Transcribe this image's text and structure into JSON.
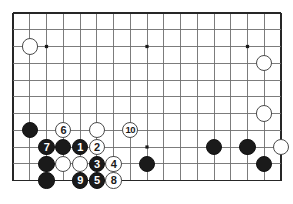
{
  "figure": {
    "kind": "go-board-diagram",
    "title": "",
    "board": {
      "cols": 17,
      "rows": 11,
      "left": 13,
      "top": 13,
      "spacing": 16.75,
      "line_color": "#6e6e6e",
      "border_color": "#262626",
      "background": "#ffffff",
      "stone_radius": 8.2
    },
    "star_points": [
      {
        "col": 2,
        "row": 2
      },
      {
        "col": 8,
        "row": 2
      },
      {
        "col": 14,
        "row": 2
      },
      {
        "col": 8,
        "row": 8
      }
    ],
    "stones": [
      {
        "id": "w-upper-left-corner",
        "color": "white",
        "col": 1,
        "row": 2,
        "label": ""
      },
      {
        "id": "w-right-upper",
        "color": "white",
        "col": 15,
        "row": 3,
        "label": ""
      },
      {
        "id": "w-right-mid",
        "color": "white",
        "col": 15,
        "row": 6,
        "label": ""
      },
      {
        "id": "b-left-shoulder",
        "color": "black",
        "col": 1,
        "row": 7,
        "label": ""
      },
      {
        "id": "w-move-6",
        "color": "white",
        "col": 3,
        "row": 7,
        "label": "6"
      },
      {
        "id": "w-upper-wall",
        "color": "white",
        "col": 5,
        "row": 7,
        "label": ""
      },
      {
        "id": "w-move-10",
        "color": "white",
        "col": 7,
        "row": 7,
        "label": "10"
      },
      {
        "id": "b-move-7",
        "color": "black",
        "col": 2,
        "row": 8,
        "label": "7"
      },
      {
        "id": "b-wall-upper",
        "color": "black",
        "col": 3,
        "row": 8,
        "label": ""
      },
      {
        "id": "b-move-1",
        "color": "black",
        "col": 4,
        "row": 8,
        "label": "1"
      },
      {
        "id": "w-move-2",
        "color": "white",
        "col": 5,
        "row": 8,
        "label": "2"
      },
      {
        "id": "b-right-group-a",
        "color": "black",
        "col": 12,
        "row": 8,
        "label": ""
      },
      {
        "id": "b-right-group-b",
        "color": "black",
        "col": 14,
        "row": 8,
        "label": ""
      },
      {
        "id": "w-right-lower",
        "color": "white",
        "col": 16,
        "row": 8,
        "label": ""
      },
      {
        "id": "b-left-wall-mid",
        "color": "black",
        "col": 2,
        "row": 9,
        "label": ""
      },
      {
        "id": "w-captured-a",
        "color": "white",
        "col": 3,
        "row": 9,
        "label": ""
      },
      {
        "id": "w-captured-b",
        "color": "white",
        "col": 4,
        "row": 9,
        "label": ""
      },
      {
        "id": "b-move-3",
        "color": "black",
        "col": 5,
        "row": 9,
        "label": "3"
      },
      {
        "id": "w-move-4",
        "color": "white",
        "col": 6,
        "row": 9,
        "label": "4"
      },
      {
        "id": "b-center-lone",
        "color": "black",
        "col": 8,
        "row": 9,
        "label": ""
      },
      {
        "id": "b-right-group-c",
        "color": "black",
        "col": 15,
        "row": 9,
        "label": ""
      },
      {
        "id": "b-left-wall-low",
        "color": "black",
        "col": 2,
        "row": 10,
        "label": ""
      },
      {
        "id": "b-move-9",
        "color": "black",
        "col": 4,
        "row": 10,
        "label": "9"
      },
      {
        "id": "b-move-5",
        "color": "black",
        "col": 5,
        "row": 10,
        "label": "5"
      },
      {
        "id": "w-move-8",
        "color": "white",
        "col": 6,
        "row": 10,
        "label": "8"
      }
    ],
    "move_sequence": [
      "1",
      "2",
      "3",
      "4",
      "5",
      "6",
      "7",
      "8",
      "9",
      "10"
    ]
  }
}
